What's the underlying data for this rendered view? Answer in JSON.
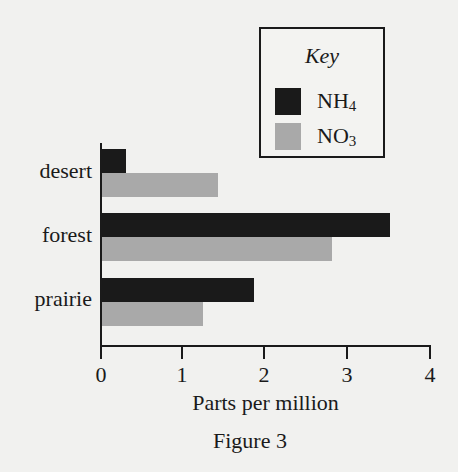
{
  "chart_data": {
    "type": "bar",
    "orientation": "horizontal",
    "title": "",
    "caption": "Figure 3",
    "xlabel": "Parts per million",
    "ylabel": "",
    "xlim": [
      0,
      4
    ],
    "x_ticks": [
      "0",
      "1",
      "2",
      "3",
      "4"
    ],
    "grid": false,
    "legend_position": "top-right",
    "legend_title": "Key",
    "categories": [
      "desert",
      "forest",
      "prairie"
    ],
    "series": [
      {
        "name": "NH4",
        "name_base": "NH",
        "name_sub": "4",
        "color": "#1a1a1a",
        "values": [
          0.3,
          3.5,
          1.85
        ]
      },
      {
        "name": "NO3",
        "name_base": "NO",
        "name_sub": "3",
        "color": "#a9a9a9",
        "values": [
          1.42,
          2.8,
          1.24
        ]
      }
    ]
  }
}
